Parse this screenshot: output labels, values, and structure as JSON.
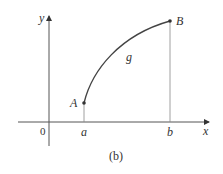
{
  "figure": {
    "caption": "(b)",
    "axes": {
      "x_label": "x",
      "y_label": "y",
      "origin_label": "0"
    },
    "points": [
      {
        "name": "A",
        "tick_label": "a"
      },
      {
        "name": "B",
        "tick_label": "b"
      }
    ],
    "curve_label": "g",
    "colors": {
      "axis": "#555555",
      "curve": "#444444",
      "guide": "#888888",
      "text": "#333333"
    }
  }
}
